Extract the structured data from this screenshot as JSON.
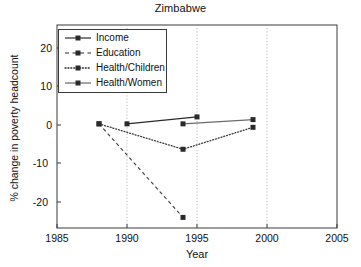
{
  "chart_data": {
    "type": "line",
    "title": "Zimbabwe",
    "xlabel": "Year",
    "ylabel": "% change in poverty headcount",
    "xlim": [
      1985,
      2005
    ],
    "ylim": [
      -25,
      24
    ],
    "xticks": [
      "1985",
      "1990",
      "1995",
      "2000",
      "2005"
    ],
    "yticks": [
      "20",
      "10",
      "0",
      "-10",
      "-20"
    ],
    "grid": "vertical dotted gridlines at 1990, 1995 and 2000",
    "legend_position": "upper left, inside axes",
    "series": [
      {
        "name": "Income",
        "style": "solid line with square markers",
        "color": "#333333",
        "x": [
          1990,
          1995
        ],
        "y": [
          0.3,
          2.1
        ]
      },
      {
        "name": "Education",
        "style": "dashed line with square markers",
        "color": "#333333",
        "x": [
          1988,
          1994
        ],
        "y": [
          0.3,
          -24.0
        ]
      },
      {
        "name": "Health/Children",
        "style": "dotted line with square markers",
        "color": "#333333",
        "x": [
          1988,
          1994,
          1999
        ],
        "y": [
          0.3,
          -6.3,
          -0.6
        ]
      },
      {
        "name": "Health/Women",
        "style": "solid line with square markers",
        "color": "#555555",
        "x": [
          1994,
          1999
        ],
        "y": [
          0.3,
          1.4
        ]
      }
    ]
  },
  "legend": {
    "items": [
      {
        "label": "Income"
      },
      {
        "label": "Education"
      },
      {
        "label": "Health/Children"
      },
      {
        "label": "Health/Women"
      }
    ]
  },
  "axes": {
    "yticks": [
      {
        "label": "20"
      },
      {
        "label": "10"
      },
      {
        "label": "0"
      },
      {
        "label": "-10"
      },
      {
        "label": "-20"
      }
    ],
    "xticks": [
      {
        "label": "1985"
      },
      {
        "label": "1990"
      },
      {
        "label": "1995"
      },
      {
        "label": "2000"
      },
      {
        "label": "2005"
      }
    ]
  }
}
